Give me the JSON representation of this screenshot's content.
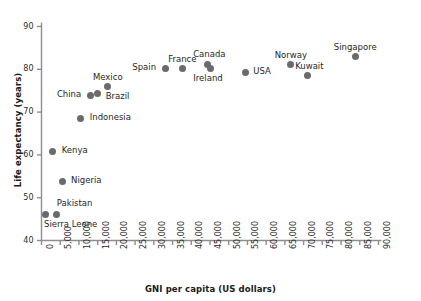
{
  "chart_data": {
    "type": "scatter",
    "title": "",
    "xlabel": "GNI per capita (US dollars)",
    "ylabel": "Life expectancy (years)",
    "xlim": [
      0,
      90000
    ],
    "ylim": [
      40,
      90
    ],
    "xticks": [
      "0",
      "5,000",
      "10,000",
      "15,000",
      "20,000",
      "25,000",
      "30,000",
      "35,000",
      "40,000",
      "45,000",
      "50,000",
      "55,000",
      "60,000",
      "65,000",
      "70,000",
      "75,000",
      "80,000",
      "85,000",
      "90,000"
    ],
    "xtick_values": [
      0,
      5000,
      10000,
      15000,
      20000,
      25000,
      30000,
      35000,
      40000,
      45000,
      50000,
      55000,
      60000,
      65000,
      70000,
      75000,
      80000,
      85000,
      90000
    ],
    "yticks": [
      "40",
      "50",
      "60",
      "70",
      "80",
      "90"
    ],
    "ytick_values": [
      40,
      50,
      60,
      70,
      80,
      90
    ],
    "grid": false,
    "legend": "none",
    "marker_color": "#6b6b6b",
    "points": [
      {
        "name": "Sierra Leone",
        "x": 1200,
        "y": 46.0,
        "label_dx": -2,
        "label_dy": 10,
        "label_anchor": "start"
      },
      {
        "name": "Pakistan",
        "x": 4100,
        "y": 46.0,
        "label_dx": 0,
        "label_dy": -11,
        "label_anchor": "start"
      },
      {
        "name": "Nigeria",
        "x": 5500,
        "y": 53.8,
        "label_dx": 9,
        "label_dy": -1,
        "label_anchor": "start"
      },
      {
        "name": "Kenya",
        "x": 3000,
        "y": 60.7,
        "label_dx": 9,
        "label_dy": -1,
        "label_anchor": "start"
      },
      {
        "name": "Indonesia",
        "x": 10500,
        "y": 68.4,
        "label_dx": 9,
        "label_dy": -1,
        "label_anchor": "start"
      },
      {
        "name": "China",
        "x": 13000,
        "y": 73.9,
        "label_dx": -9,
        "label_dy": -1,
        "label_anchor": "end"
      },
      {
        "name": "Brazil",
        "x": 15000,
        "y": 74.4,
        "label_dx": 8,
        "label_dy": 3,
        "label_anchor": "start"
      },
      {
        "name": "Mexico",
        "x": 17700,
        "y": 76.0,
        "label_dx": 0,
        "label_dy": -9,
        "label_anchor": "middle"
      },
      {
        "name": "Spain",
        "x": 33000,
        "y": 80.3,
        "label_dx": -9,
        "label_dy": -1,
        "label_anchor": "end"
      },
      {
        "name": "France",
        "x": 37600,
        "y": 80.3,
        "label_dx": 0,
        "label_dy": -9,
        "label_anchor": "middle"
      },
      {
        "name": "Canada",
        "x": 44300,
        "y": 81.2,
        "label_dx": 2,
        "label_dy": -10,
        "label_anchor": "middle"
      },
      {
        "name": "Ireland",
        "x": 45000,
        "y": 80.1,
        "label_dx": -2,
        "label_dy": 10,
        "label_anchor": "middle"
      },
      {
        "name": "USA",
        "x": 54400,
        "y": 79.3,
        "label_dx": 8,
        "label_dy": -1,
        "label_anchor": "start"
      },
      {
        "name": "Norway",
        "x": 66600,
        "y": 81.1,
        "label_dx": 0,
        "label_dy": -9,
        "label_anchor": "middle"
      },
      {
        "name": "Kuwait",
        "x": 71000,
        "y": 78.6,
        "label_dx": 2,
        "label_dy": -9,
        "label_anchor": "middle"
      },
      {
        "name": "Singapore",
        "x": 83800,
        "y": 83.1,
        "label_dx": 0,
        "label_dy": -9,
        "label_anchor": "middle"
      }
    ]
  }
}
